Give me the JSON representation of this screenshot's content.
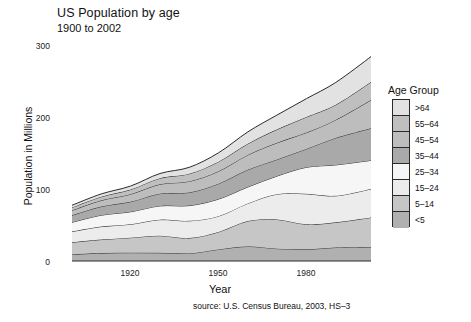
{
  "chart_data": {
    "type": "area",
    "title": "US Population by age",
    "subtitle": "1900 to 2002",
    "xlabel": "Year",
    "ylabel": "Population in Millions",
    "source": "source: U.S. Census Bureau, 2003, HS–3",
    "legend_title": "Age Group",
    "legend_position": "right",
    "grid": false,
    "stacked": true,
    "xlim": [
      1900,
      2002
    ],
    "ylim": [
      0,
      300
    ],
    "xticks": [
      1920,
      1950,
      1980
    ],
    "yticks": [
      0,
      100,
      200,
      300
    ],
    "x": [
      1900,
      1910,
      1920,
      1930,
      1940,
      1950,
      1960,
      1970,
      1980,
      1990,
      2002
    ],
    "series": [
      {
        "name": "<5",
        "color": "#b0b0b0",
        "values": [
          9.2,
          11.0,
          11.6,
          11.4,
          10.6,
          16.2,
          20.3,
          17.2,
          16.3,
          18.8,
          19.6
        ]
      },
      {
        "name": "5–14",
        "color": "#c6c6c6",
        "values": [
          16.9,
          18.9,
          20.9,
          23.9,
          21.4,
          24.3,
          35.5,
          40.7,
          34.9,
          35.1,
          41.1
        ]
      },
      {
        "name": "15–24",
        "color": "#ececec",
        "values": [
          15.0,
          18.1,
          18.7,
          22.4,
          24.0,
          22.1,
          24.6,
          35.4,
          42.5,
          37.0,
          39.8
        ]
      },
      {
        "name": "25–34",
        "color": "#f6f6f6",
        "values": [
          12.9,
          15.9,
          17.5,
          19.2,
          21.3,
          23.8,
          22.9,
          25.3,
          37.1,
          43.2,
          39.9
        ]
      },
      {
        "name": "35–44",
        "color": "#a9a9a9",
        "values": [
          9.8,
          12.1,
          14.0,
          17.1,
          18.3,
          21.5,
          24.1,
          23.1,
          25.6,
          37.6,
          44.8
        ]
      },
      {
        "name": "45–54",
        "color": "#bdbdbd",
        "values": [
          6.8,
          8.6,
          10.5,
          13.1,
          15.5,
          17.3,
          20.6,
          23.3,
          22.8,
          25.2,
          39.4
        ]
      },
      {
        "name": "55–64",
        "color": "#bfbfbf",
        "values": [
          4.1,
          5.1,
          6.5,
          8.4,
          10.6,
          13.4,
          15.6,
          18.7,
          21.7,
          21.1,
          25.1
        ]
      },
      {
        "name": ">64",
        "color": "#e2e2e2",
        "values": [
          3.1,
          3.9,
          4.9,
          6.6,
          9.0,
          12.4,
          16.6,
          20.1,
          25.7,
          31.2,
          35.5
        ]
      }
    ],
    "totals": [
      77.8,
      93.6,
      104.6,
      122.1,
      130.7,
      151.0,
      180.2,
      203.8,
      226.6,
      249.2,
      285.2
    ]
  },
  "legend": {
    "title": "Age Group",
    "items": [
      {
        "label": ">64",
        "color": "#e2e2e2"
      },
      {
        "label": "55–64",
        "color": "#bfbfbf"
      },
      {
        "label": "45–54",
        "color": "#bdbdbd"
      },
      {
        "label": "35–44",
        "color": "#a9a9a9"
      },
      {
        "label": "25–34",
        "color": "#f6f6f6"
      },
      {
        "label": "15–24",
        "color": "#ececec"
      },
      {
        "label": "5–14",
        "color": "#c6c6c6"
      },
      {
        "label": "<5",
        "color": "#b0b0b0"
      }
    ]
  },
  "axes": {
    "ytick_labels": [
      "300",
      "200",
      "100",
      "0"
    ],
    "xtick_labels": [
      "1920",
      "1950",
      "1980"
    ]
  }
}
